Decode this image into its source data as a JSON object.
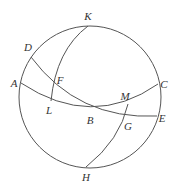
{
  "diagram": {
    "type": "spherical-geometry",
    "stroke_color": "#555555",
    "label_color": "#333333",
    "circle": {
      "cx": 90,
      "cy": 97,
      "r": 71
    },
    "points": [
      {
        "name": "K",
        "label": "K",
        "x": 88,
        "y": 26,
        "lx": 88,
        "ly": 20
      },
      {
        "name": "D",
        "label": "D",
        "x": 31,
        "y": 57,
        "lx": 28,
        "ly": 51
      },
      {
        "name": "A",
        "label": "A",
        "x": 21,
        "y": 83,
        "lx": 14,
        "ly": 87
      },
      {
        "name": "C",
        "label": "C",
        "x": 158,
        "y": 84,
        "lx": 164,
        "ly": 88
      },
      {
        "name": "E",
        "label": "E",
        "x": 157,
        "y": 116,
        "lx": 162,
        "ly": 122
      },
      {
        "name": "H",
        "label": "H",
        "x": 86,
        "y": 167,
        "lx": 86,
        "ly": 181
      },
      {
        "name": "F",
        "label": "F",
        "x": 53,
        "y": 85,
        "lx": 60,
        "ly": 84
      },
      {
        "name": "L",
        "label": "L",
        "x": 51,
        "y": 101,
        "lx": 49,
        "ly": 114
      },
      {
        "name": "B",
        "label": "B",
        "x": 92,
        "y": 110,
        "lx": 90,
        "ly": 124
      },
      {
        "name": "M",
        "label": "M",
        "x": 128,
        "y": 104,
        "lx": 125,
        "ly": 100
      },
      {
        "name": "G",
        "label": "G",
        "x": 124,
        "y": 119,
        "lx": 128,
        "ly": 130
      }
    ],
    "arcs": [
      {
        "name": "arc-AC",
        "d": "M21,83 Q92,130 158,84"
      },
      {
        "name": "arc-DE",
        "d": "M31,57 Q78,120 157,116"
      },
      {
        "name": "arc-KL",
        "d": "M88,26 Q56,50 51,101"
      },
      {
        "name": "arc-MH",
        "d": "M128,104 Q120,140 86,167"
      }
    ]
  }
}
